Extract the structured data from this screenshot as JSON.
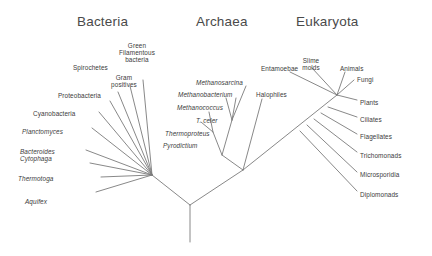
{
  "figure": {
    "background": "#ffffff",
    "line_color": "#7a7a7a",
    "text_color": "#3b3b3b",
    "header_color": "#4a4a4a"
  },
  "domains": [
    {
      "name": "bacteria-header",
      "label": "Bacteria",
      "x": 77,
      "y": 14
    },
    {
      "name": "archaea-header",
      "label": "Archaea",
      "x": 196,
      "y": 14
    },
    {
      "name": "eukaryota-header",
      "label": "Eukaryota",
      "x": 296,
      "y": 14
    }
  ],
  "labels": {
    "bacteria": [
      {
        "text": "Spirochetes",
        "x": 73,
        "y": 64,
        "italic": false,
        "align": "left"
      },
      {
        "text": "Green\nFilamentous\nbacteria",
        "x": 137,
        "y": 42,
        "italic": false,
        "align": "center"
      },
      {
        "text": "Gram\npositives",
        "x": 124,
        "y": 74,
        "italic": false,
        "align": "center"
      },
      {
        "text": "Proteobacteria",
        "x": 58,
        "y": 92,
        "italic": false,
        "align": "left"
      },
      {
        "text": "Cyanobacteria",
        "x": 33,
        "y": 110,
        "italic": false,
        "align": "left"
      },
      {
        "text": "Planctomyces",
        "x": 22,
        "y": 128,
        "italic": true,
        "align": "left"
      },
      {
        "text": "Bacteroides\nCytophaga",
        "x": 20,
        "y": 148,
        "italic": true,
        "align": "left"
      },
      {
        "text": "Thermotoga",
        "x": 18,
        "y": 175,
        "italic": true,
        "align": "left"
      },
      {
        "text": "Aquifex",
        "x": 25,
        "y": 198,
        "italic": true,
        "align": "left"
      }
    ],
    "archaea": [
      {
        "text": "Methanosarcina",
        "x": 196,
        "y": 79,
        "italic": true,
        "align": "left"
      },
      {
        "text": "Methanobacterium",
        "x": 178,
        "y": 91,
        "italic": true,
        "align": "left"
      },
      {
        "text": "Methanococcus",
        "x": 177,
        "y": 104,
        "italic": true,
        "align": "left"
      },
      {
        "text": "T. celer",
        "x": 196,
        "y": 117,
        "italic": true,
        "align": "left"
      },
      {
        "text": "Thermoproteus",
        "x": 165,
        "y": 130,
        "italic": true,
        "align": "left"
      },
      {
        "text": "Pyrodictium",
        "x": 163,
        "y": 142,
        "italic": true,
        "align": "left"
      },
      {
        "text": "Halophiles",
        "x": 256,
        "y": 91,
        "italic": false,
        "align": "left"
      }
    ],
    "eukaryota": [
      {
        "text": "Entamoebae",
        "x": 261,
        "y": 65,
        "italic": false,
        "align": "left"
      },
      {
        "text": "Slime\nmolds",
        "x": 311,
        "y": 57,
        "italic": false,
        "align": "center"
      },
      {
        "text": "Animals",
        "x": 340,
        "y": 65,
        "italic": false,
        "align": "left"
      },
      {
        "text": "Fungi",
        "x": 357,
        "y": 76,
        "italic": false,
        "align": "left"
      },
      {
        "text": "Plants",
        "x": 360,
        "y": 99,
        "italic": false,
        "align": "left"
      },
      {
        "text": "Ciliates",
        "x": 360,
        "y": 116,
        "italic": false,
        "align": "left"
      },
      {
        "text": "Flagellates",
        "x": 360,
        "y": 133,
        "italic": false,
        "align": "left"
      },
      {
        "text": "Trichomonads",
        "x": 360,
        "y": 152,
        "italic": false,
        "align": "left"
      },
      {
        "text": "Microsporidia",
        "x": 360,
        "y": 171,
        "italic": false,
        "align": "left"
      },
      {
        "text": "Diplomonads",
        "x": 360,
        "y": 191,
        "italic": false,
        "align": "left"
      }
    ]
  },
  "tree": {
    "root_stem": "M190,242 L190,205",
    "bacteria_arm": "M190,205 L152,175",
    "archaea_euk_arm": "M190,205 L243,170",
    "bacteria_branches": [
      "M152,175 L143,80",
      "M152,175 L130,86",
      "M152,175 L118,92",
      "M152,175 L110,101",
      "M152,175 L99,112",
      "M152,175 L92,128",
      "M152,175 L86,150",
      "M152,175 L90,163",
      "M152,175 L101,177",
      "M152,175 L96,192"
    ],
    "archaea_branches": [
      "M243,170 L222,155",
      "M222,155 L232,120",
      "M232,120 L246,86",
      "M232,120 L236,98",
      "M232,120 L226,98",
      "M222,155 L213,132",
      "M213,132 L209,112",
      "M213,132 L201,122",
      "M243,170 L262,99"
    ],
    "euk_spine": [
      "M243,170 L337,95",
      "M300,131 L357,191",
      "M307,125 L357,172",
      "M314,119 L357,152",
      "M321,113 L357,134",
      "M328,107 L357,117",
      "M337,95 L357,100"
    ],
    "euk_crown": [
      "M337,95 L312,68",
      "M337,95 L290,72",
      "M337,95 L345,72",
      "M337,95 L354,80"
    ]
  }
}
